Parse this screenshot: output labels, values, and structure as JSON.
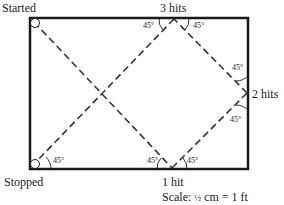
{
  "labels": {
    "start": "Started",
    "stop": "Stopped",
    "hit1": "1 hit",
    "hit2": "2 hits",
    "hit3": "3 hits",
    "scale_prefix": "Scale:",
    "scale_fraction": "½",
    "scale_suffix": "cm = 1 ft"
  },
  "angles": {
    "a_stop": "45°",
    "a_hit1_left": "45°",
    "a_hit1_right": "45°",
    "a_hit2_top": "45°",
    "a_hit2_bottom": "45°",
    "a_hit3_left": "45°",
    "a_hit3_right": "45°"
  },
  "colors": {
    "border": "#1a1a1a",
    "path": "#333333"
  }
}
